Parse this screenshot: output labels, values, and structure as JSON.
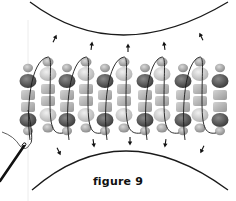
{
  "figure": {
    "caption": "figure 9"
  },
  "colors": {
    "background": "#ffffff",
    "line": "#1a1a1a",
    "bead_dark": "#5a5a5a",
    "bead_mid": "#9a9a9a",
    "bead_light": "#cfcfcf",
    "guide_line": "#e6e6e6"
  },
  "layout": {
    "dark_columns_x": [
      28,
      67,
      105,
      145,
      183,
      220
    ],
    "light_columns_x": [
      48,
      86,
      124,
      162,
      200
    ],
    "thread_loops_x": [
      48,
      86,
      124,
      162,
      200
    ],
    "arrows_up_x": [
      56,
      92,
      128,
      164,
      200
    ],
    "arrows_down_x": [
      60,
      94,
      130,
      165,
      201
    ]
  },
  "icons": {
    "needle": "needle-icon",
    "arrow_up": "arrow-up-icon",
    "arrow_down": "arrow-down-icon"
  }
}
